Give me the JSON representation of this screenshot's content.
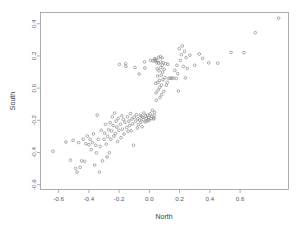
{
  "chart_data": {
    "type": "scatter",
    "title": "",
    "xlabel": "North",
    "ylabel": "South",
    "xlim": [
      -0.72,
      0.92
    ],
    "ylim": [
      -0.63,
      0.47
    ],
    "grid": false,
    "legend": null,
    "xticks": [
      -0.6,
      -0.4,
      -0.2,
      0.0,
      0.2,
      0.4,
      0.6
    ],
    "xtick_labels": [
      "-0.6",
      "-0.4",
      "-0.2",
      "0.0",
      "0.2",
      "0.4",
      "0.6"
    ],
    "yticks": [
      -0.6,
      -0.4,
      -0.2,
      0.0,
      0.2,
      0.4
    ],
    "ytick_labels": [
      "-0.6",
      "-0.4",
      "-0.2",
      "0.0",
      "0.2",
      "0.4"
    ],
    "marker": {
      "shape": "circle",
      "size": 1.35,
      "color": "#8a8a8a",
      "filled": false
    },
    "n_points": 166,
    "points": [
      [
        0.855,
        0.435
      ],
      [
        0.7,
        0.345
      ],
      [
        0.625,
        0.22
      ],
      [
        0.54,
        0.222
      ],
      [
        0.452,
        0.155
      ],
      [
        0.392,
        0.157
      ],
      [
        0.352,
        0.185
      ],
      [
        0.33,
        0.212
      ],
      [
        0.3,
        0.142
      ],
      [
        0.268,
        0.205
      ],
      [
        0.25,
        0.122
      ],
      [
        0.243,
        0.19
      ],
      [
        0.238,
        0.064
      ],
      [
        0.232,
        0.228
      ],
      [
        0.225,
        0.135
      ],
      [
        0.218,
        0.262
      ],
      [
        0.212,
        0.208
      ],
      [
        0.205,
        0.172
      ],
      [
        0.198,
        0.245
      ],
      [
        0.192,
        -0.018
      ],
      [
        0.188,
        0.09
      ],
      [
        0.182,
        0.142
      ],
      [
        0.178,
        0.06
      ],
      [
        0.168,
        0.11
      ],
      [
        0.158,
        0.062
      ],
      [
        0.148,
        0.062
      ],
      [
        0.138,
        0.062
      ],
      [
        0.128,
        0.06
      ],
      [
        0.122,
        0.148
      ],
      [
        0.118,
        0.035
      ],
      [
        0.112,
        0.018
      ],
      [
        0.108,
        0.152
      ],
      [
        0.102,
        0.065
      ],
      [
        0.098,
        0.118
      ],
      [
        0.095,
        -0.02
      ],
      [
        0.092,
        0.158
      ],
      [
        0.09,
        0.052
      ],
      [
        0.088,
        0.1
      ],
      [
        0.086,
        0.143
      ],
      [
        0.084,
        0.188
      ],
      [
        0.082,
        -0.04
      ],
      [
        0.08,
        0.018
      ],
      [
        0.078,
        0.08
      ],
      [
        0.076,
        0.128
      ],
      [
        0.074,
        0.162
      ],
      [
        0.072,
        0.196
      ],
      [
        0.07,
        -0.058
      ],
      [
        0.068,
        0.005
      ],
      [
        0.066,
        0.048
      ],
      [
        0.064,
        0.108
      ],
      [
        0.062,
        0.155
      ],
      [
        0.06,
        0.19
      ],
      [
        0.058,
        -0.012
      ],
      [
        0.056,
        0.035
      ],
      [
        0.054,
        0.075
      ],
      [
        0.052,
        0.12
      ],
      [
        0.05,
        0.158
      ],
      [
        0.048,
        0.172
      ],
      [
        0.046,
        -0.075
      ],
      [
        0.044,
        -0.03
      ],
      [
        0.042,
        0.03
      ],
      [
        0.04,
        0.168
      ],
      [
        0.038,
        0.178
      ],
      [
        0.036,
        0.183
      ],
      [
        0.034,
        -0.15
      ],
      [
        0.032,
        -0.17
      ],
      [
        0.03,
        -0.185
      ],
      [
        0.028,
        -0.192
      ],
      [
        0.024,
        0.17
      ],
      [
        0.02,
        -0.138
      ],
      [
        0.016,
        -0.175
      ],
      [
        0.012,
        -0.188
      ],
      [
        0.008,
        0.172
      ],
      [
        0.004,
        -0.16
      ],
      [
        0.0,
        -0.2
      ],
      [
        -0.004,
        -0.182
      ],
      [
        -0.008,
        -0.195
      ],
      [
        -0.012,
        -0.168
      ],
      [
        -0.016,
        -0.205
      ],
      [
        -0.02,
        -0.188
      ],
      [
        -0.024,
        -0.172
      ],
      [
        -0.028,
        -0.21
      ],
      [
        -0.03,
        0.125
      ],
      [
        -0.032,
        0.163
      ],
      [
        -0.036,
        -0.155
      ],
      [
        -0.04,
        -0.195
      ],
      [
        -0.044,
        -0.182
      ],
      [
        -0.048,
        -0.24
      ],
      [
        -0.052,
        -0.175
      ],
      [
        -0.056,
        -0.212
      ],
      [
        -0.06,
        -0.168
      ],
      [
        -0.064,
        -0.198
      ],
      [
        -0.068,
        0.088
      ],
      [
        -0.072,
        -0.228
      ],
      [
        -0.076,
        -0.19
      ],
      [
        -0.08,
        -0.248
      ],
      [
        -0.085,
        -0.165
      ],
      [
        -0.09,
        -0.205
      ],
      [
        -0.095,
        0.128
      ],
      [
        -0.1,
        -0.18
      ],
      [
        -0.105,
        -0.355
      ],
      [
        -0.11,
        -0.222
      ],
      [
        -0.115,
        -0.192
      ],
      [
        -0.12,
        -0.265
      ],
      [
        -0.125,
        -0.158
      ],
      [
        -0.13,
        -0.232
      ],
      [
        -0.135,
        -0.205
      ],
      [
        -0.14,
        -0.268
      ],
      [
        -0.145,
        -0.178
      ],
      [
        -0.15,
        -0.245
      ],
      [
        -0.155,
        0.135
      ],
      [
        -0.158,
        0.152
      ],
      [
        -0.162,
        -0.212
      ],
      [
        -0.168,
        -0.285
      ],
      [
        -0.172,
        -0.195
      ],
      [
        -0.178,
        -0.255
      ],
      [
        -0.182,
        -0.172
      ],
      [
        -0.188,
        -0.308
      ],
      [
        -0.192,
        -0.225
      ],
      [
        -0.198,
        0.148
      ],
      [
        -0.202,
        -0.262
      ],
      [
        -0.206,
        -0.188
      ],
      [
        -0.21,
        -0.332
      ],
      [
        -0.215,
        -0.242
      ],
      [
        -0.22,
        -0.205
      ],
      [
        -0.225,
        -0.282
      ],
      [
        -0.23,
        -0.155
      ],
      [
        -0.235,
        -0.298
      ],
      [
        -0.24,
        -0.232
      ],
      [
        -0.245,
        -0.178
      ],
      [
        -0.25,
        -0.265
      ],
      [
        -0.255,
        -0.318
      ],
      [
        -0.26,
        -0.215
      ],
      [
        -0.265,
        -0.402
      ],
      [
        -0.27,
        -0.258
      ],
      [
        -0.275,
        -0.3
      ],
      [
        -0.28,
        -0.428
      ],
      [
        -0.285,
        -0.348
      ],
      [
        -0.29,
        -0.225
      ],
      [
        -0.295,
        -0.28
      ],
      [
        -0.3,
        -0.318
      ],
      [
        -0.31,
        -0.452
      ],
      [
        -0.318,
        -0.262
      ],
      [
        -0.325,
        -0.362
      ],
      [
        -0.33,
        -0.522
      ],
      [
        -0.338,
        -0.318
      ],
      [
        -0.345,
        -0.168
      ],
      [
        -0.35,
        -0.402
      ],
      [
        -0.355,
        -0.355
      ],
      [
        -0.362,
        -0.478
      ],
      [
        -0.37,
        -0.285
      ],
      [
        -0.378,
        -0.338
      ],
      [
        -0.385,
        -0.382
      ],
      [
        -0.392,
        -0.318
      ],
      [
        -0.4,
        -0.352
      ],
      [
        -0.41,
        -0.298
      ],
      [
        -0.42,
        -0.345
      ],
      [
        -0.428,
        -0.455
      ],
      [
        -0.438,
        -0.318
      ],
      [
        -0.448,
        -0.452
      ],
      [
        -0.458,
        -0.492
      ],
      [
        -0.468,
        -0.338
      ],
      [
        -0.478,
        -0.522
      ],
      [
        -0.488,
        -0.498
      ],
      [
        -0.505,
        -0.325
      ],
      [
        -0.522,
        -0.448
      ],
      [
        -0.552,
        -0.335
      ],
      [
        -0.638,
        -0.392
      ]
    ]
  }
}
